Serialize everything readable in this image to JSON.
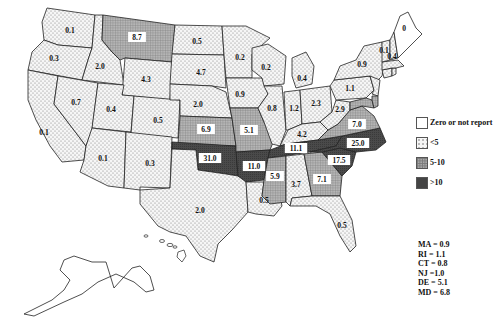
{
  "legend": {
    "items": [
      {
        "label": "Zero or not report",
        "class": "zero",
        "color": "#ffffff"
      },
      {
        "label": "<5",
        "class": "low",
        "color": "#eeeeee"
      },
      {
        "label": "5-10",
        "class": "mid",
        "color": "#9a9a9a"
      },
      {
        "label": ">10",
        "class": "high",
        "color": "#444444"
      }
    ]
  },
  "small_state_notes": [
    "MA = 0.9",
    "RI = 1.1",
    "CT = 0.8",
    "NJ =1.0",
    "DE = 5.1",
    "MD = 6.8"
  ],
  "chart_data": {
    "type": "choropleth",
    "title": "",
    "region": "United States",
    "bins": [
      "Zero or not report",
      "<5",
      "5-10",
      ">10"
    ],
    "states": [
      {
        "state": "WA",
        "value": 0.1
      },
      {
        "state": "OR",
        "value": 0.3
      },
      {
        "state": "CA",
        "value": 0.1
      },
      {
        "state": "ID",
        "value": 2.0
      },
      {
        "state": "NV",
        "value": 0.7
      },
      {
        "state": "MT",
        "value": 8.7
      },
      {
        "state": "WY",
        "value": 4.3
      },
      {
        "state": "UT",
        "value": 0.4
      },
      {
        "state": "AZ",
        "value": 0.1
      },
      {
        "state": "CO",
        "value": 0.5
      },
      {
        "state": "NM",
        "value": 0.3
      },
      {
        "state": "ND",
        "value": 0.5
      },
      {
        "state": "SD",
        "value": 4.7
      },
      {
        "state": "NE",
        "value": 2.0
      },
      {
        "state": "KS",
        "value": 6.9
      },
      {
        "state": "OK",
        "value": 31.0
      },
      {
        "state": "TX",
        "value": 2.0
      },
      {
        "state": "MN",
        "value": 0.2
      },
      {
        "state": "IA",
        "value": 0.9
      },
      {
        "state": "MO",
        "value": 5.1
      },
      {
        "state": "AR",
        "value": 11.0
      },
      {
        "state": "LA",
        "value": 0.5
      },
      {
        "state": "WI",
        "value": 0.2
      },
      {
        "state": "IL",
        "value": 0.8
      },
      {
        "state": "MI",
        "value": 0.4
      },
      {
        "state": "IN",
        "value": 1.2
      },
      {
        "state": "OH",
        "value": 2.3
      },
      {
        "state": "KY",
        "value": 4.2
      },
      {
        "state": "TN",
        "value": 11.1
      },
      {
        "state": "MS",
        "value": 5.9
      },
      {
        "state": "AL",
        "value": 3.7
      },
      {
        "state": "GA",
        "value": 7.1
      },
      {
        "state": "FL",
        "value": 0.5
      },
      {
        "state": "SC",
        "value": 17.5
      },
      {
        "state": "NC",
        "value": 25.0
      },
      {
        "state": "VA",
        "value": 7.0
      },
      {
        "state": "WV",
        "value": 2.9
      },
      {
        "state": "PA",
        "value": 1.1
      },
      {
        "state": "NY",
        "value": 0.9
      },
      {
        "state": "VT",
        "value": 0.1
      },
      {
        "state": "NH",
        "value": 0.4
      },
      {
        "state": "ME",
        "value": 0
      },
      {
        "state": "MA",
        "value": 0.9
      },
      {
        "state": "RI",
        "value": 1.1
      },
      {
        "state": "CT",
        "value": 0.8
      },
      {
        "state": "NJ",
        "value": 1.0
      },
      {
        "state": "DE",
        "value": 5.1
      },
      {
        "state": "MD",
        "value": 6.8
      },
      {
        "state": "AK",
        "value": null
      },
      {
        "state": "HI",
        "value": null
      }
    ]
  },
  "labels": {
    "WA": "0.1",
    "OR": "0.3",
    "CA": "0.1",
    "ID": "2.0",
    "NV": "0.7",
    "MT": "8.7",
    "WY": "4.3",
    "UT": "0.4",
    "AZ": "0.1",
    "CO": "0.5",
    "NM": "0.3",
    "ND": "0.5",
    "SD": "4.7",
    "NE": "2.0",
    "KS": "6.9",
    "OK": "31.0",
    "TX": "2.0",
    "MN": "0.2",
    "IA": "0.9",
    "MO": "5.1",
    "AR": "11.0",
    "LA": "0.5",
    "WI": "0.2",
    "IL": "0.8",
    "MI": "0.4",
    "IN": "1.2",
    "OH": "2.3",
    "KY": "4.2",
    "TN": "11.1",
    "MS": "5.9",
    "AL": "3.7",
    "GA": "7.1",
    "FL": "0.5",
    "SC": "17.5",
    "NC": "25.0",
    "VA": "7.0",
    "WV": "2.9",
    "PA": "1.1",
    "NY": "0.9",
    "VT": "0.1",
    "NH": "0.4",
    "ME": "0"
  }
}
